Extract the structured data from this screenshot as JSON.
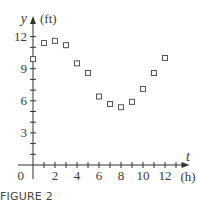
{
  "chart_data": {
    "type": "scatter",
    "title": "",
    "xlabel": "t",
    "xunit": "(h)",
    "ylabel": "y",
    "yunit": "(ft)",
    "x_ticks": [
      2,
      4,
      6,
      8,
      10,
      12
    ],
    "y_ticks": [
      3,
      6,
      9,
      12
    ],
    "origin_label": "0",
    "xlim": [
      0,
      13.5
    ],
    "ylim": [
      0,
      13
    ],
    "grid": false,
    "marker": "open-square",
    "series": [
      {
        "name": "water depth",
        "x": [
          0,
          1,
          2,
          3,
          4,
          5,
          6,
          7,
          8,
          9,
          10,
          11,
          12
        ],
        "y": [
          9.9,
          11.4,
          11.6,
          11.2,
          9.5,
          8.6,
          6.4,
          5.7,
          5.4,
          5.9,
          7.1,
          8.6,
          10.0
        ]
      }
    ]
  },
  "caption": "FIGURE 2",
  "colors": {
    "axis": "#333333",
    "marker": "#555555",
    "text": "#3a3a3a"
  }
}
